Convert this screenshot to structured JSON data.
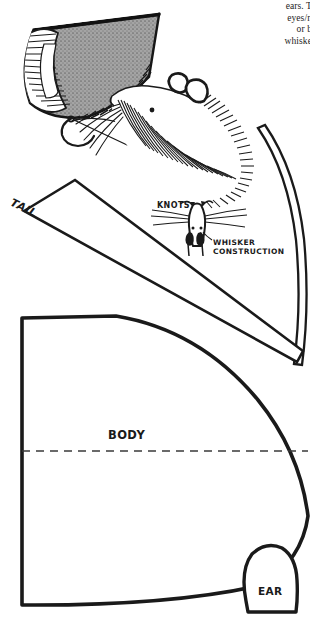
{
  "page": {
    "type": "sewing-pattern-page",
    "background_color": "#ffffff",
    "ink_color": "#1a1a1a",
    "shading_color": "#9a9a9a",
    "width": 310,
    "height": 621
  },
  "instructions": {
    "lines": [
      "ears.  T",
      "eyes/n",
      "or b",
      "whiske"
    ],
    "note": "right-edge body copy clipped by page crop"
  },
  "pattern_pieces": [
    {
      "name": "tail",
      "label": "TAIL",
      "shape": "tapered-strip",
      "rotation_deg": 26
    },
    {
      "name": "body",
      "label": "BODY",
      "shape": "leaf-teardrop",
      "fold_line": "dashed-horizontal"
    },
    {
      "name": "ear",
      "label": "EAR",
      "shape": "rounded-dome"
    },
    {
      "name": "tail-curve",
      "label": "",
      "shape": "long-curved-strip"
    }
  ],
  "illustrations": {
    "cone": {
      "name": "stuffed-body-cone",
      "description": "gray shaded cone with hatched open end and curved sewing needle with thread"
    },
    "mouse_head": {
      "name": "mouse-head-sketch",
      "description": "hatched mouse head with two ears, eye, and whiskers"
    },
    "whisker_detail": {
      "name": "whisker-construction-detail",
      "knots_label": "KNOTS",
      "caption": "WHISKER CONSTRUCTION"
    }
  },
  "labels": {
    "tail": "TAIL",
    "body": "BODY",
    "ear": "EAR",
    "knots": "KNOTS",
    "whisker_construction": "WHISKER CONSTRUCTION"
  }
}
